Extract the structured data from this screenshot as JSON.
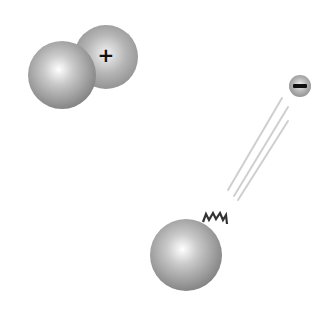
{
  "diagram": {
    "molecule": {
      "neutral_sphere": {
        "cx": 62,
        "cy": 75,
        "r": 34
      },
      "positive_sphere": {
        "cx": 106,
        "cy": 57,
        "r": 32,
        "label": "+"
      }
    },
    "negative_particle": {
      "cx": 300,
      "cy": 86,
      "r": 11,
      "label": "–"
    },
    "streaks": [
      {
        "x1": 282,
        "y1": 98,
        "x2": 228,
        "y2": 190
      },
      {
        "x1": 288,
        "y1": 107,
        "x2": 234,
        "y2": 196
      },
      {
        "x1": 288,
        "y1": 121,
        "x2": 238,
        "y2": 200
      }
    ],
    "broken_sphere": {
      "cx": 186,
      "cy": 255,
      "r": 36
    },
    "colors": {
      "sphere_light": "#ffffff",
      "sphere_mid": "#b8b8b8",
      "sphere_dark": "#7a7a7a",
      "sign": "#111111",
      "streak": "#cccccc"
    }
  }
}
